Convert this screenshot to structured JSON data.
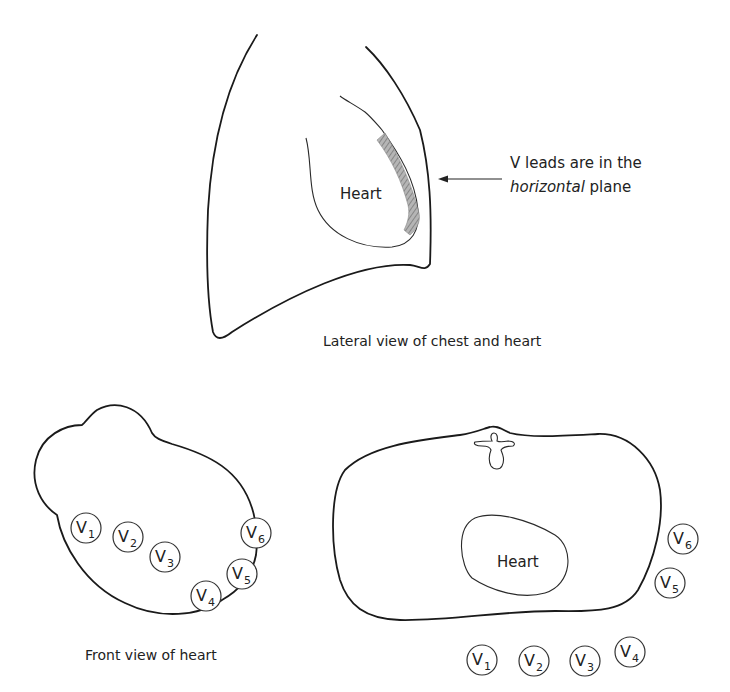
{
  "lateral_view": {
    "caption": "Lateral view of chest and heart",
    "heart_label": "Heart",
    "annotation": {
      "line1": "V leads are in the",
      "line2_italic": "horizontal",
      "line2_rest": " plane"
    },
    "hatch_color": "#9a9a9a"
  },
  "front_view": {
    "caption": "Front view of heart",
    "leads": [
      {
        "letter": "V",
        "num": "1"
      },
      {
        "letter": "V",
        "num": "2"
      },
      {
        "letter": "V",
        "num": "3"
      },
      {
        "letter": "V",
        "num": "4"
      },
      {
        "letter": "V",
        "num": "5"
      },
      {
        "letter": "V",
        "num": "6"
      }
    ]
  },
  "cross_section": {
    "heart_label": "Heart",
    "leads": [
      {
        "letter": "V",
        "num": "1"
      },
      {
        "letter": "V",
        "num": "2"
      },
      {
        "letter": "V",
        "num": "3"
      },
      {
        "letter": "V",
        "num": "4"
      },
      {
        "letter": "V",
        "num": "5"
      },
      {
        "letter": "V",
        "num": "6"
      }
    ]
  }
}
